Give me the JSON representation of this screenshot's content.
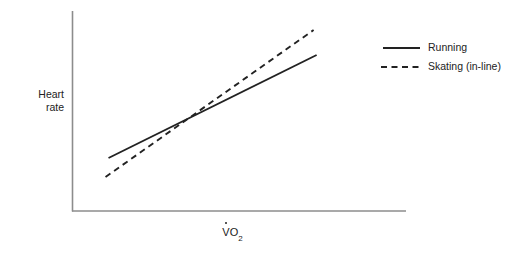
{
  "chart_data": {
    "type": "line",
    "title": "",
    "subtitle": "",
    "xlabel": "VO2",
    "xlabel_parts": {
      "symbol": "V",
      "dot_over_symbol": true,
      "element": "O",
      "subscript": "2"
    },
    "ylabel": "Heart rate",
    "ylabel_lines": [
      "Heart",
      "rate"
    ],
    "grid": false,
    "axis_ticks": false,
    "tick_labels": [],
    "axis_color": "#8c8c8c",
    "line_color": "#222222",
    "legend_position": "right",
    "xlim": [
      0,
      100
    ],
    "ylim": [
      0,
      100
    ],
    "series": [
      {
        "name": "Running",
        "style": "solid",
        "color": "#222222",
        "x": [
          10.8,
          73.2
        ],
        "values": [
          26.5,
          78.0
        ]
      },
      {
        "name": "Skating (in-line)",
        "style": "dashed",
        "color": "#222222",
        "x": [
          9.9,
          72.3
        ],
        "values": [
          17.0,
          90.5
        ]
      }
    ],
    "annotations": [
      {
        "label": "intersection",
        "x": 38.5,
        "y": 49.0
      }
    ]
  },
  "legend": {
    "items": [
      {
        "label": "Running",
        "style": "solid"
      },
      {
        "label": "Skating (in-line)",
        "style": "dashed"
      }
    ]
  },
  "caption": {
    "cropped_text": ""
  }
}
